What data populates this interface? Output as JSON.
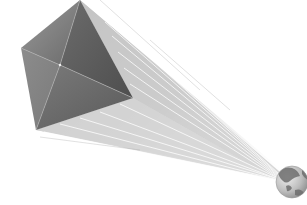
{
  "illustration": {
    "subject": "pyramid-beaming-light-to-globe",
    "description": "Gray four-sided pyramid viewed from above emitting converging light rays toward a small globe",
    "colors": {
      "background": "#ffffff",
      "pyramid_dark": "#5a5a5a",
      "pyramid_mid": "#808080",
      "pyramid_light": "#a8a8a8",
      "ray_start": "#b8b8b8",
      "ray_end": "#ffffff",
      "globe_ocean": "#c8c8c8",
      "globe_land": "#6e6e6e"
    }
  }
}
